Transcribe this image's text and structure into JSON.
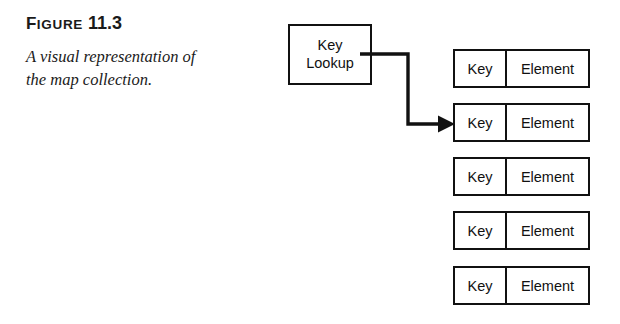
{
  "figure": {
    "label_prefix": "F",
    "label_word": "IGURE",
    "number": "11.3",
    "caption": "A visual representation of the map collection."
  },
  "diagram": {
    "lookup_box": {
      "line1": "Key",
      "line2": "Lookup"
    },
    "connector": {
      "arrow_target_row_index": 2,
      "stroke_color": "#111111"
    },
    "row_headers": {
      "key": "Key",
      "element": "Element"
    },
    "rows": [
      {
        "key": "Key",
        "element": "Element"
      },
      {
        "key": "Key",
        "element": "Element"
      },
      {
        "key": "Key",
        "element": "Element"
      },
      {
        "key": "Key",
        "element": "Element"
      },
      {
        "key": "Key",
        "element": "Element"
      }
    ]
  },
  "colors": {
    "background": "#ffffff",
    "ink": "#111111",
    "text": "#1a1a1a"
  }
}
